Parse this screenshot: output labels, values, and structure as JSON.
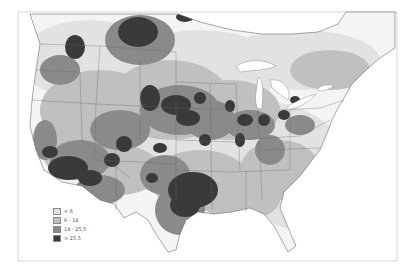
{
  "map": {
    "region": "Contiguous United States",
    "style": "grayscale contour map with state and province boundaries",
    "colors": {
      "background": "#ffffff",
      "land_lowest": "#f4f4f4",
      "border": "#555555",
      "frame": "#aaaaaa"
    }
  },
  "legend": {
    "items": [
      {
        "label": "< 6",
        "color": "#e2e2e2"
      },
      {
        "label": "6 - 14",
        "color": "#c0c0c0"
      },
      {
        "label": "14 - 25.5",
        "color": "#8a8a8a"
      },
      {
        "label": "> 25.5",
        "color": "#3a3a3a"
      }
    ]
  }
}
